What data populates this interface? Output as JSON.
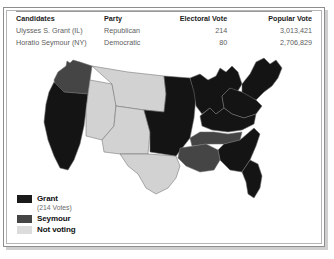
{
  "table": {
    "headers": {
      "candidates": "Candidates",
      "party": "Party",
      "electoral_vote": "Electoral Vote",
      "popular_vote": "Popular Vote"
    },
    "rows": [
      {
        "candidate": "Ulysses S. Grant (IL)",
        "party": "Republican",
        "electoral_vote": "214",
        "popular_vote": "3,013,421"
      },
      {
        "candidate": "Horatio Seymour (NY)",
        "party": "Democratic",
        "electoral_vote": "80",
        "popular_vote": "2,706,829"
      }
    ]
  },
  "legend": {
    "items": [
      {
        "label": "Grant",
        "sub": "(214 Votes)",
        "color": "#1a1a1a"
      },
      {
        "label": "Seymour",
        "sub": "",
        "color": "#454545"
      },
      {
        "label": "Not voting",
        "sub": "",
        "color": "#dcdcdc"
      }
    ]
  },
  "map": {
    "colors": {
      "grant": "#141414",
      "seymour": "#454545",
      "not_voting": "#d2d2d2",
      "border": "#6f6f6f",
      "background": "#ffffff"
    },
    "regions": [
      {
        "name": "pacific-northwest",
        "fill": "seymour"
      },
      {
        "name": "california",
        "fill": "grant"
      },
      {
        "name": "great-basin",
        "fill": "not_voting"
      },
      {
        "name": "southwest",
        "fill": "not_voting"
      },
      {
        "name": "texas",
        "fill": "not_voting"
      },
      {
        "name": "great-plains",
        "fill": "not_voting"
      },
      {
        "name": "midwest",
        "fill": "grant"
      },
      {
        "name": "great-lakes",
        "fill": "grant"
      },
      {
        "name": "northeast",
        "fill": "grant"
      },
      {
        "name": "mid-atlantic",
        "fill": "grant"
      },
      {
        "name": "upper-south",
        "fill": "grant"
      },
      {
        "name": "kentucky",
        "fill": "seymour"
      },
      {
        "name": "deep-south",
        "fill": "grant"
      },
      {
        "name": "gulf-coast",
        "fill": "seymour"
      },
      {
        "name": "florida",
        "fill": "grant"
      }
    ]
  }
}
